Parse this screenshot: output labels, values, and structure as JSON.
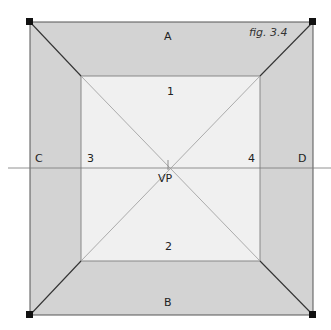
{
  "figure": {
    "caption": "fig. 3.4",
    "labels": {
      "top": "A",
      "bottom": "B",
      "left": "C",
      "right": "D",
      "inner_top": "1",
      "inner_bottom": "2",
      "inner_left": "3",
      "inner_right": "4",
      "vanishing_point": "VP"
    },
    "colors": {
      "outer_fill": "#d3d3d3",
      "inner_fill": "#f0f0f0",
      "line": "#555555",
      "diagonal": "#333333",
      "corner_marker": "#111111"
    }
  }
}
